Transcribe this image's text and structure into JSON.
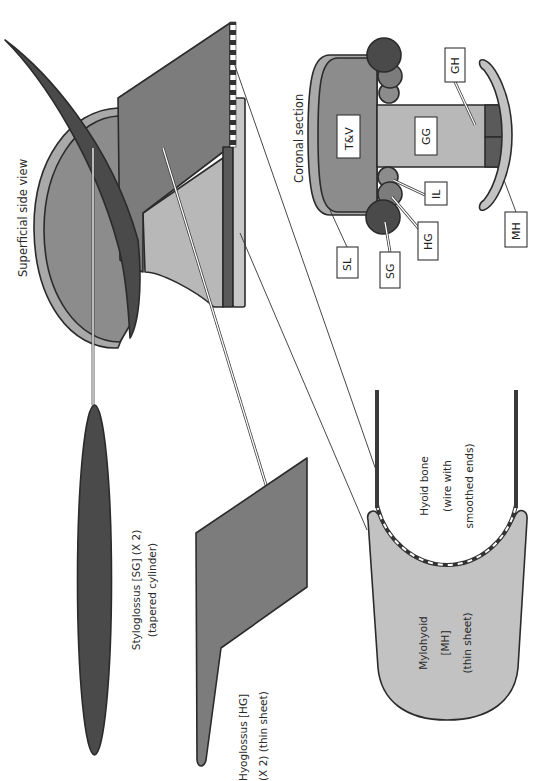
{
  "colors": {
    "dark": "#4a4a4a",
    "mid_dark": "#7c7c7c",
    "mid": "#8c8c8c",
    "light": "#b8b8b8",
    "rim": "#a9a9a9",
    "very_light": "#c8c8c8",
    "outline": "#2b2b2b"
  },
  "side_view": {
    "title": "Superficial side view"
  },
  "coronal_section": {
    "title": "Coronal section",
    "labels": {
      "tv": "T&V",
      "gg": "GG",
      "gh": "GH",
      "il": "IL",
      "hg": "HG",
      "sg": "SG",
      "sl": "SL",
      "mh": "MH"
    }
  },
  "components": {
    "styloglossus": {
      "line1": "Styloglossus [SG] (X 2)",
      "line2": "(tapered cylinder)"
    },
    "hyoglossus": {
      "line1": "Hyoglossus [HG]",
      "line2": "(X 2) (thin sheet)"
    },
    "hyoid": {
      "line1": "Hyoid bone",
      "line2": "(wire with",
      "line3": "smoothed ends)"
    },
    "mylohyoid": {
      "line1": "Mylohyoid",
      "line2": "[MH]",
      "line3": "(thin sheet)"
    }
  }
}
